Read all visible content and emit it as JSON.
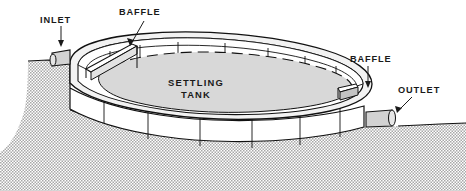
{
  "figure": {
    "type": "technical-illustration",
    "background_color": "#ffffff",
    "line_color": "#111111"
  },
  "labels": {
    "inlet": "INLET",
    "baffle_left": "BAFFLE",
    "baffle_right": "BAFFLE",
    "outlet": "OUTLET",
    "tank_line1": "SETTLING",
    "tank_line2": "TANK"
  },
  "colors": {
    "ground_fill": "#c9c9c9",
    "water_fill": "#d8d8d8",
    "wall_fill": "#ffffff",
    "rim_fill": "#f2f2f2",
    "pipe_fill": "#d2d2d2",
    "ink": "#111111"
  },
  "parts": [
    {
      "name": "inlet-pipe",
      "label": "INLET",
      "side": "left"
    },
    {
      "name": "baffle-left",
      "label": "BAFFLE",
      "side": "left"
    },
    {
      "name": "settling-tank",
      "label": "SETTLING TANK",
      "side": "center"
    },
    {
      "name": "baffle-right",
      "label": "BAFFLE",
      "side": "right"
    },
    {
      "name": "outlet-pipe",
      "label": "OUTLET",
      "side": "right"
    },
    {
      "name": "ground",
      "label": "",
      "side": "background"
    }
  ]
}
